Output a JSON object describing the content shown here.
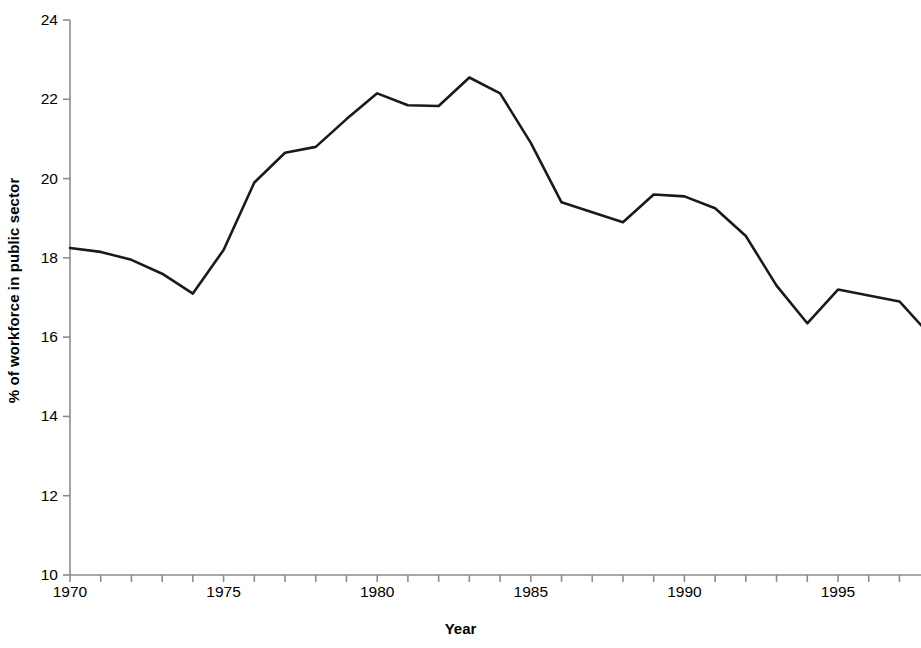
{
  "chart_data": {
    "type": "line",
    "title": "",
    "xlabel": "Year",
    "ylabel": "% of workforce in public sector",
    "xlim": [
      1970,
      1998
    ],
    "ylim": [
      10,
      24
    ],
    "y_ticks": [
      10,
      12,
      14,
      16,
      18,
      20,
      22,
      24
    ],
    "y_tick_labels": [
      "10",
      "12",
      "14",
      "16",
      "18",
      "20",
      "22",
      "24"
    ],
    "x_ticks": [
      1970,
      1971,
      1972,
      1973,
      1974,
      1975,
      1976,
      1977,
      1978,
      1979,
      1980,
      1981,
      1982,
      1983,
      1984,
      1985,
      1986,
      1987,
      1988,
      1989,
      1990,
      1991,
      1992,
      1993,
      1994,
      1995,
      1996,
      1997,
      1998
    ],
    "x_tick_labels_shown": [
      "1970",
      "1975",
      "1980",
      "1985",
      "1990",
      "1995"
    ],
    "x_labeled_ticks": [
      1970,
      1975,
      1980,
      1985,
      1990,
      1995
    ],
    "grid": false,
    "legend": null,
    "line_color": "#1a1a1a",
    "line_width": 2.6,
    "x": [
      1970,
      1971,
      1972,
      1973,
      1974,
      1975,
      1976,
      1977,
      1978,
      1979,
      1980,
      1981,
      1982,
      1983,
      1984,
      1985,
      1986,
      1987,
      1988,
      1989,
      1990,
      1991,
      1992,
      1993,
      1994,
      1995,
      1996,
      1997,
      1998
    ],
    "values": [
      18.25,
      18.15,
      17.95,
      17.6,
      17.1,
      18.2,
      19.9,
      20.65,
      20.8,
      21.5,
      22.15,
      21.85,
      21.83,
      22.55,
      22.15,
      20.9,
      19.4,
      19.15,
      18.9,
      19.6,
      19.55,
      19.25,
      18.55,
      17.3,
      16.35,
      17.2,
      17.05,
      16.9,
      16.05
    ],
    "series": [
      {
        "name": "% of workforce in public sector",
        "values": [
          18.25,
          18.15,
          17.95,
          17.6,
          17.1,
          18.2,
          19.9,
          20.65,
          20.8,
          21.5,
          22.15,
          21.85,
          21.83,
          22.55,
          22.15,
          20.9,
          19.4,
          19.15,
          18.9,
          19.6,
          19.55,
          19.25,
          18.55,
          17.3,
          16.35,
          17.2,
          17.05,
          16.9,
          16.05
        ]
      }
    ]
  },
  "axes": {
    "y_title": "% of workforce in public sector",
    "x_title": "Year"
  }
}
